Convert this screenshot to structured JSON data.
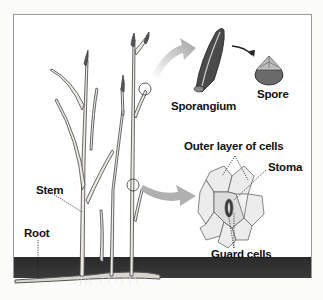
{
  "diagram": {
    "labels": {
      "sporangium": "Sporangium",
      "spore": "Spore",
      "outer_layer": "Outer layer of cells",
      "stoma": "Stoma",
      "guard_cells": "Guard cells",
      "stem": "Stem",
      "root": "Root"
    },
    "colors": {
      "soil": "#2f2f2f",
      "arrow": "#a9a9a9",
      "stem_fill": "#e8e6e0",
      "outline": "#333333"
    }
  }
}
